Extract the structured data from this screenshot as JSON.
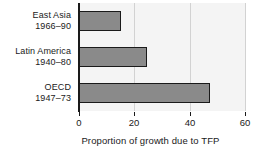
{
  "chart_data": {
    "type": "bar",
    "orientation": "horizontal",
    "title": "",
    "xlabel": "Proportion of growth due to TFP",
    "ylabel": "",
    "categories": [
      "East Asia 1966–90",
      "Latin America 1940–80",
      "OECD 1947–73"
    ],
    "category_lines": [
      {
        "line1": "East Asia",
        "line2": "1966–90"
      },
      {
        "line1": "Latin America",
        "line2": "1940–80"
      },
      {
        "line1": "OECD",
        "line2": "1947–73"
      }
    ],
    "values": [
      15,
      24.5,
      47.5
    ],
    "xlim": [
      0,
      60
    ],
    "ylim": [
      0,
      3
    ],
    "xticks": [
      0,
      20,
      40,
      60
    ],
    "xtick_labels": [
      "0",
      "20",
      "40",
      "60"
    ],
    "grid": true,
    "grid_axis": "x",
    "legend": false,
    "colors": {
      "bar_fill": "#8a8a8a",
      "bar_edge": "#1a1a1a",
      "plot_background": "#f4f4f4",
      "figure_background": "#ffffff",
      "gridline": "#d2d2d2",
      "text": "#1a1a1a"
    }
  }
}
